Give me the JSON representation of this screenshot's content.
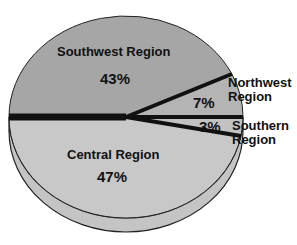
{
  "chart_data": {
    "type": "pie",
    "title": "",
    "style": "3d-exploded-wedges",
    "slices": [
      {
        "label": "Southwest Region",
        "value": 43,
        "display": "43%",
        "color": "#a6a6a6"
      },
      {
        "label": "Northwest Region",
        "value": 7,
        "display": "7%",
        "color": "#b4b4b4"
      },
      {
        "label": "Southern Region",
        "value": 3,
        "display": "3%",
        "color": "#c2c2c2"
      },
      {
        "label": "Central Region",
        "value": 47,
        "display": "47%",
        "color": "#c8c8c8"
      }
    ],
    "separator_color": "#111111",
    "edge_color": "#222222"
  },
  "labels": {
    "southwest_name": "Southwest Region",
    "southwest_pct": "43%",
    "northwest_name_line1": "Northwest",
    "northwest_name_line2": "Region",
    "northwest_pct": "7%",
    "southern_name_line1": "Southern",
    "southern_name_line2": "Region",
    "southern_pct": "3%",
    "central_name": "Central Region",
    "central_pct": "47%"
  }
}
